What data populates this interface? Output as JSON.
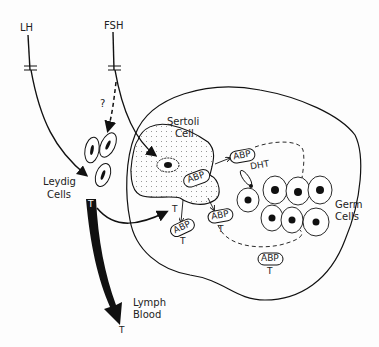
{
  "diagram": {
    "hormones": {
      "lh": "LH",
      "fsh": "FSH",
      "question": "?"
    },
    "cells": {
      "sertoli_line1": "Sertoli",
      "sertoli_line2": "Cell",
      "leydig_line1": "Leydig",
      "leydig_line2": "Cells",
      "germ_line1": "Germ",
      "germ_line2": "Cells"
    },
    "output": {
      "lymph": "Lymph",
      "blood": "Blood"
    },
    "molecules": {
      "abp": "ABP",
      "t": "T",
      "dht": "DHT"
    }
  }
}
